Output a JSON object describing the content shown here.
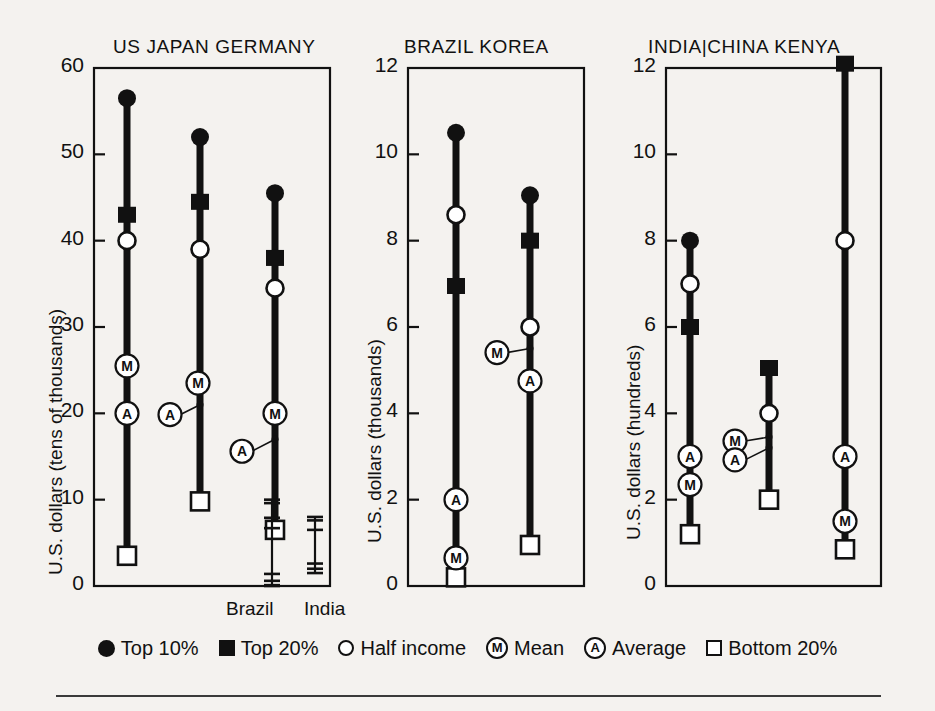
{
  "figure": {
    "background_color": "#f4f2ef",
    "ink_color": "#111111"
  },
  "legend": {
    "position": "bottom",
    "items": [
      {
        "symbol": "circle-filled",
        "label": "Top 10%"
      },
      {
        "symbol": "square-filled",
        "label": "Top 20%"
      },
      {
        "symbol": "circle-open",
        "label": "Half income"
      },
      {
        "symbol": "letter-M",
        "label": "Mean"
      },
      {
        "symbol": "letter-A",
        "label": "Average"
      },
      {
        "symbol": "square-open",
        "label": "Bottom 20%"
      }
    ]
  },
  "chart_data": [
    {
      "type": "scatter",
      "panel": 1,
      "title": "US  JAPAN  GERMANY",
      "ylabel": "U.S. dollars (tens of thousands)",
      "xlabel": "",
      "ylim": [
        0,
        60
      ],
      "yticks": [
        0,
        10,
        20,
        30,
        40,
        50,
        60
      ],
      "grid": false,
      "categories": [
        "US",
        "JAPAN",
        "GERMANY"
      ],
      "series": [
        {
          "name": "Top 10%",
          "symbol": "circle-filled",
          "values": [
            56.5,
            52.0,
            45.5
          ]
        },
        {
          "name": "Top 20%",
          "symbol": "square-filled",
          "values": [
            43.0,
            44.5,
            38.0
          ]
        },
        {
          "name": "Half income",
          "symbol": "circle-open",
          "values": [
            40.0,
            39.0,
            34.5
          ]
        },
        {
          "name": "Mean",
          "symbol": "letter-M",
          "values": [
            25.5,
            23.5,
            20.0
          ]
        },
        {
          "name": "Average",
          "symbol": "letter-A",
          "values": [
            20.0,
            21.0,
            17.0
          ]
        },
        {
          "name": "Bottom 20%",
          "symbol": "square-open",
          "values": [
            3.5,
            9.8,
            6.5
          ]
        }
      ],
      "annotations": [
        {
          "label": "Brazil",
          "type": "mini-scale-bar",
          "value_top": 10.0,
          "value_bottom": 0.0
        },
        {
          "label": "India",
          "type": "mini-scale-bar",
          "value_top": 8.0,
          "value_bottom": 1.5
        }
      ]
    },
    {
      "type": "scatter",
      "panel": 2,
      "title": "BRAZIL  KOREA",
      "ylabel": "U.S. dollars (thousands)",
      "xlabel": "",
      "ylim": [
        0,
        12
      ],
      "yticks": [
        0,
        2,
        4,
        6,
        8,
        10,
        12
      ],
      "grid": false,
      "categories": [
        "BRAZIL",
        "KOREA"
      ],
      "series": [
        {
          "name": "Top 10%",
          "symbol": "circle-filled",
          "values": [
            10.5,
            9.05
          ]
        },
        {
          "name": "Top 20%",
          "symbol": "square-filled",
          "values": [
            6.95,
            8.0
          ]
        },
        {
          "name": "Half income",
          "symbol": "circle-open",
          "values": [
            8.6,
            6.0
          ]
        },
        {
          "name": "Mean",
          "symbol": "letter-M",
          "values": [
            0.65,
            5.5
          ]
        },
        {
          "name": "Average",
          "symbol": "letter-A",
          "values": [
            2.0,
            4.75
          ]
        },
        {
          "name": "Bottom 20%",
          "symbol": "square-open",
          "values": [
            0.2,
            0.95
          ]
        }
      ],
      "annotations": []
    },
    {
      "type": "scatter",
      "panel": 3,
      "title": "INDIA|CHINA  KENYA",
      "ylabel": "U.S. dollars (hundreds)",
      "xlabel": "",
      "ylim": [
        0,
        12
      ],
      "yticks": [
        0,
        2,
        4,
        6,
        8,
        10,
        12
      ],
      "grid": false,
      "categories": [
        "INDIA",
        "CHINA",
        "KENYA"
      ],
      "series": [
        {
          "name": "Top 10%",
          "symbol": "circle-filled",
          "values": [
            8.0,
            null,
            null
          ]
        },
        {
          "name": "Top 20%",
          "symbol": "square-filled",
          "values": [
            6.0,
            5.05,
            12.1
          ]
        },
        {
          "name": "Half income",
          "symbol": "circle-open",
          "values": [
            7.0,
            4.0,
            8.0
          ]
        },
        {
          "name": "Mean",
          "symbol": "letter-M",
          "values": [
            2.35,
            3.45,
            1.5
          ]
        },
        {
          "name": "Average",
          "symbol": "letter-A",
          "values": [
            3.0,
            3.2,
            3.0
          ]
        },
        {
          "name": "Bottom 20%",
          "symbol": "square-open",
          "values": [
            1.2,
            2.0,
            0.85
          ]
        }
      ],
      "annotations": []
    }
  ]
}
